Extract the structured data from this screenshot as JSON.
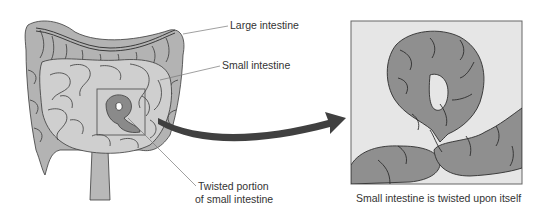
{
  "figure": {
    "labels": {
      "large_intestine": "Large intestine",
      "small_intestine": "Small intestine",
      "twisted_line1": "Twisted portion",
      "twisted_line2": "of small intestine",
      "caption": "Small intestine is twisted upon itself"
    },
    "colors": {
      "large_intestine_fill": "#b3b3b3",
      "small_intestine_fill": "#cfcfcf",
      "twisted_fill": "#8a8a8a",
      "panel_bg": "#e6e6e6",
      "panel_loop_fill": "#8f8f8f",
      "outline": "#3a3a3a",
      "arrow": "#404040",
      "text": "#333333"
    }
  }
}
